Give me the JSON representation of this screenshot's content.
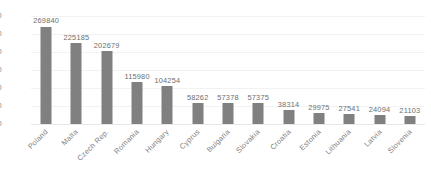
{
  "chart_data": {
    "type": "bar",
    "title": "",
    "subtitle": "",
    "xlabel": "",
    "ylabel": "",
    "categories": [
      "Poland",
      "Malta",
      "Czech Rep.",
      "Romania",
      "Hungary",
      "Cyprus",
      "Bulgaria",
      "Slovakia",
      "Croatia",
      "Estonia",
      "Lithuania",
      "Latvia",
      "Slovenia"
    ],
    "values": [
      269840,
      225185,
      202679,
      115980,
      104254,
      58262,
      57378,
      57375,
      38314,
      29975,
      27541,
      24094,
      21103
    ],
    "value_labels": [
      "269840",
      "225185",
      "202679",
      "115980",
      "104254",
      "58262",
      "57378",
      "57375",
      "38314",
      "29975",
      "27541",
      "24094",
      "21103"
    ],
    "ylim": [
      0,
      300000
    ],
    "ytick_values": [
      0,
      50000,
      100000,
      150000,
      200000,
      250000,
      300000
    ],
    "ytick_labels": [
      "0",
      "50000",
      "100000",
      "150000",
      "200000",
      "250000",
      "300000"
    ],
    "grid": true,
    "legend": false,
    "legend_position": "none",
    "data_labels_shown": true,
    "bar_color": "#808080",
    "gridline_color": "#f2f2f2",
    "axis_text_color": "#7f7f7f",
    "background_color": "#ffffff",
    "series": [
      {
        "name": "",
        "values": [
          269840,
          225185,
          202679,
          115980,
          104254,
          58262,
          57378,
          57375,
          38314,
          29975,
          27541,
          24094,
          21103
        ]
      }
    ]
  }
}
